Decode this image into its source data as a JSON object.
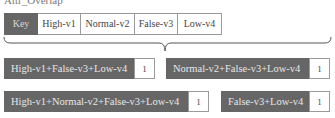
{
  "title": "Attr_Overlap",
  "key": {
    "header": "Key",
    "items": [
      "High-v1",
      "Normal-v2",
      "False-v3",
      "Low-v4"
    ]
  },
  "combinations": [
    {
      "label": "High-v1+False-v3+Low-v4",
      "count": "1"
    },
    {
      "label": "Normal-v2+False-v3+Low-v4",
      "count": "1"
    },
    {
      "label": "High-v1+Normal-v2+False-v3+Low-v4",
      "count": "1"
    },
    {
      "label": "False-v3+Low-v4",
      "count": "1"
    }
  ],
  "colors": {
    "dark_fill": "#666666",
    "light_fill": "#ffffff",
    "border": "#9a9a9a"
  }
}
